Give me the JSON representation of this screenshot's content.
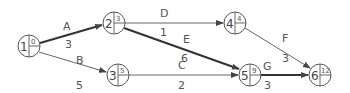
{
  "diagram": {
    "type": "activity-on-arrow network",
    "nodes": [
      {
        "id": "1",
        "value": "0",
        "cx": 29,
        "cy": 46
      },
      {
        "id": "2",
        "value": "3",
        "cx": 114,
        "cy": 23
      },
      {
        "id": "3",
        "value": "5",
        "cx": 118,
        "cy": 75
      },
      {
        "id": "4",
        "value": "4",
        "cx": 235,
        "cy": 23
      },
      {
        "id": "5",
        "value": "9",
        "cx": 250,
        "cy": 75
      },
      {
        "id": "6",
        "value": "12",
        "cx": 320,
        "cy": 75
      }
    ],
    "edges": [
      {
        "activity": "A",
        "duration": "3",
        "from": "1",
        "to": "2",
        "critical": true
      },
      {
        "activity": "B",
        "duration": "5",
        "from": "1",
        "to": "3",
        "critical": false
      },
      {
        "activity": "C",
        "duration": "2",
        "from": "3",
        "to": "5",
        "critical": false
      },
      {
        "activity": "D",
        "duration": "1",
        "from": "2",
        "to": "4",
        "critical": false
      },
      {
        "activity": "E",
        "duration": "6",
        "from": "2",
        "to": "5",
        "critical": true
      },
      {
        "activity": "F",
        "duration": "3",
        "from": "4",
        "to": "6",
        "critical": false
      },
      {
        "activity": "G",
        "duration": "3",
        "from": "5",
        "to": "6",
        "critical": true
      }
    ],
    "colors": {
      "line": "#555555",
      "critical": "#333333",
      "text": "#555555"
    }
  }
}
